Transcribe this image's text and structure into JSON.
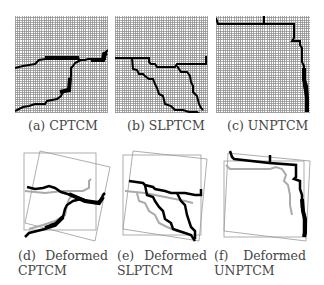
{
  "figure": {
    "panels": [
      {
        "id": "a",
        "label": "(a) CPTCM"
      },
      {
        "id": "b",
        "label": "(b) SLPTCM"
      },
      {
        "id": "c",
        "label": "(c) UNPTCM"
      },
      {
        "id": "d",
        "label_prefix": "(d)",
        "label_word": "Deformed",
        "label_name": "CPTCM"
      },
      {
        "id": "e",
        "label_prefix": "(e)",
        "label_word": "Deformed",
        "label_name": "SLPTCM"
      },
      {
        "id": "f",
        "label_prefix": "(f)",
        "label_word": "Deformed",
        "label_name": "UNPTCM"
      }
    ]
  }
}
